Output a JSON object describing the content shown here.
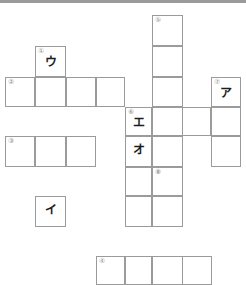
{
  "puzzle": {
    "title": "crossword-grid",
    "cell_size": 30,
    "grid_color": "#9b9b9b",
    "number_color": "#8d8d8d",
    "letter_color": "#1d1d1d",
    "background": "#ffffff",
    "numbers": [
      "①",
      "②",
      "③",
      "④",
      "⑤",
      "⑥",
      "⑦",
      "⑧"
    ],
    "letters": [
      "ア",
      "イ",
      "ウ",
      "エ",
      "オ"
    ],
    "cells": [
      {
        "name": "cell-r1c6",
        "x": 152,
        "y": 15,
        "w": 31,
        "h": 31,
        "num": "⑤",
        "ch": ""
      },
      {
        "name": "cell-r2c6",
        "x": 152,
        "y": 46,
        "w": 31,
        "h": 31,
        "num": "",
        "ch": ""
      },
      {
        "name": "cell-r2c2",
        "x": 35,
        "y": 46,
        "w": 31,
        "h": 31,
        "num": "①",
        "ch": "ウ"
      },
      {
        "name": "cell-r3c1",
        "x": 5,
        "y": 77,
        "w": 30,
        "h": 30,
        "num": "②",
        "ch": ""
      },
      {
        "name": "cell-r3c2",
        "x": 35,
        "y": 77,
        "w": 31,
        "h": 30,
        "num": "",
        "ch": ""
      },
      {
        "name": "cell-r3c3",
        "x": 66,
        "y": 77,
        "w": 30,
        "h": 30,
        "num": "",
        "ch": ""
      },
      {
        "name": "cell-r3c4",
        "x": 96,
        "y": 77,
        "w": 29,
        "h": 30,
        "num": "",
        "ch": ""
      },
      {
        "name": "cell-r3c6",
        "x": 152,
        "y": 77,
        "w": 31,
        "h": 30,
        "num": "",
        "ch": ""
      },
      {
        "name": "cell-r3c8",
        "x": 211,
        "y": 77,
        "w": 30,
        "h": 30,
        "num": "⑦",
        "ch": "ア"
      },
      {
        "name": "cell-r4c5",
        "x": 125,
        "y": 107,
        "w": 27,
        "h": 29,
        "num": "⑥",
        "ch": "エ"
      },
      {
        "name": "cell-r4c6",
        "x": 152,
        "y": 107,
        "w": 31,
        "h": 29,
        "num": "",
        "ch": ""
      },
      {
        "name": "cell-r4c7",
        "x": 182,
        "y": 107,
        "w": 29,
        "h": 29,
        "num": "",
        "ch": ""
      },
      {
        "name": "cell-r4c8",
        "x": 211,
        "y": 107,
        "w": 30,
        "h": 29,
        "num": "",
        "ch": ""
      },
      {
        "name": "cell-r5c1",
        "x": 5,
        "y": 136,
        "w": 30,
        "h": 31,
        "num": "③",
        "ch": ""
      },
      {
        "name": "cell-r5c2",
        "x": 35,
        "y": 136,
        "w": 31,
        "h": 31,
        "num": "",
        "ch": ""
      },
      {
        "name": "cell-r5c3",
        "x": 66,
        "y": 136,
        "w": 30,
        "h": 31,
        "num": "",
        "ch": ""
      },
      {
        "name": "cell-r5c5",
        "x": 125,
        "y": 136,
        "w": 27,
        "h": 31,
        "num": "",
        "ch": "オ"
      },
      {
        "name": "cell-r5c6",
        "x": 152,
        "y": 136,
        "w": 31,
        "h": 31,
        "num": "",
        "ch": ""
      },
      {
        "name": "cell-r5c8",
        "x": 211,
        "y": 136,
        "w": 30,
        "h": 31,
        "num": "",
        "ch": ""
      },
      {
        "name": "cell-r6c5",
        "x": 125,
        "y": 167,
        "w": 27,
        "h": 29,
        "num": "",
        "ch": ""
      },
      {
        "name": "cell-r6c6",
        "x": 152,
        "y": 167,
        "w": 31,
        "h": 29,
        "num": "⑧",
        "ch": ""
      },
      {
        "name": "cell-r7c2",
        "x": 35,
        "y": 196,
        "w": 31,
        "h": 31,
        "num": "",
        "ch": "イ"
      },
      {
        "name": "cell-r7c5",
        "x": 125,
        "y": 196,
        "w": 27,
        "h": 31,
        "num": "",
        "ch": ""
      },
      {
        "name": "cell-r7c6",
        "x": 152,
        "y": 196,
        "w": 31,
        "h": 31,
        "num": "",
        "ch": ""
      },
      {
        "name": "cell-r9c4",
        "x": 96,
        "y": 256,
        "w": 29,
        "h": 29,
        "num": "④",
        "ch": ""
      },
      {
        "name": "cell-r9c5",
        "x": 125,
        "y": 256,
        "w": 27,
        "h": 29,
        "num": "",
        "ch": ""
      },
      {
        "name": "cell-r9c6",
        "x": 152,
        "y": 256,
        "w": 31,
        "h": 29,
        "num": "",
        "ch": ""
      },
      {
        "name": "cell-r9c7",
        "x": 182,
        "y": 256,
        "w": 30,
        "h": 29,
        "num": "",
        "ch": ""
      }
    ]
  }
}
